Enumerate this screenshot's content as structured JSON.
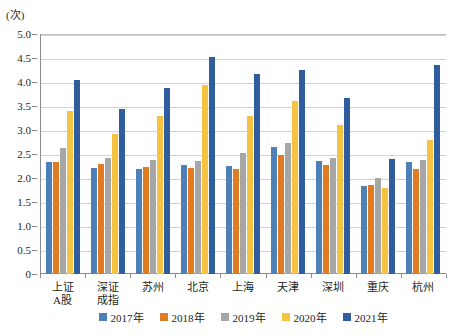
{
  "chart_data": {
    "type": "bar",
    "title": "",
    "subtitle": "",
    "ylabel": "(次)",
    "xlabel": "",
    "ylim": [
      0,
      5.0
    ],
    "ytick_labels": [
      "5.0",
      "4.5",
      "4.0",
      "3.5",
      "3.0",
      "2.5",
      "2.0",
      "1.5",
      "1.0",
      "0.5",
      "0"
    ],
    "ytick_values": [
      5.0,
      4.5,
      4.0,
      3.5,
      3.0,
      2.5,
      2.0,
      1.5,
      1.0,
      0.5,
      0
    ],
    "grid": true,
    "legend_position": "bottom",
    "categories": [
      "上证\nA股",
      "深证\n成指",
      "苏州",
      "北京",
      "上海",
      "天津",
      "深圳",
      "重庆",
      "杭州"
    ],
    "category_lines": [
      [
        "上证",
        "A股"
      ],
      [
        "深证",
        "成指"
      ],
      [
        "苏州"
      ],
      [
        "北京"
      ],
      [
        "上海"
      ],
      [
        "天津"
      ],
      [
        "深圳"
      ],
      [
        "重庆"
      ],
      [
        "杭州"
      ]
    ],
    "series": [
      {
        "name": "2017年",
        "color": "#4e80b8",
        "values": [
          2.33,
          2.2,
          2.18,
          2.27,
          2.24,
          2.64,
          2.35,
          1.84,
          2.34
        ]
      },
      {
        "name": "2018年",
        "color": "#e07b24",
        "values": [
          2.33,
          2.3,
          2.22,
          2.21,
          2.18,
          2.48,
          2.28,
          1.86,
          2.18
        ]
      },
      {
        "name": "2019年",
        "color": "#a6a6a6",
        "values": [
          2.62,
          2.42,
          2.37,
          2.35,
          2.52,
          2.72,
          2.42,
          2.0,
          2.38
        ]
      },
      {
        "name": "2020年",
        "color": "#f5c242",
        "values": [
          3.4,
          2.92,
          3.3,
          3.93,
          3.3,
          3.6,
          3.1,
          1.8,
          2.8
        ]
      },
      {
        "name": "2021年",
        "color": "#2f5d9e",
        "values": [
          4.05,
          3.43,
          3.87,
          4.52,
          4.17,
          4.25,
          3.66,
          2.4,
          4.35
        ]
      }
    ]
  }
}
